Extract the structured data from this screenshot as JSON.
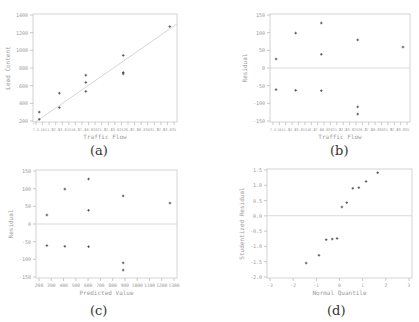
{
  "chart_data": [
    {
      "id": "a",
      "type": "scatter",
      "caption": "(a)",
      "title": "",
      "xlabel": "Traffic Flow",
      "ylabel": "Lead Content",
      "xlim": [
        7,
        37
      ],
      "ylim": [
        200,
        1400
      ],
      "yticks": [
        "1400",
        "1200",
        "1000",
        "800",
        "600",
        "400",
        "200"
      ],
      "xticks": [
        "7.5",
        "10",
        "11.3",
        "12.5",
        "13.8",
        "15",
        "16.3",
        "17.5",
        "18.8",
        "20",
        "21.3",
        "22.5",
        "23.8",
        "25",
        "26.3",
        "27.5",
        "28.8",
        "30",
        "31.3",
        "32.5",
        "33.8",
        "35"
      ],
      "grid": false,
      "has_fit_line": true,
      "fit_line": {
        "x": [
          7,
          37
        ],
        "y": [
          180,
          1290
        ]
      },
      "points": [
        {
          "x": 8.3,
          "y": 310
        },
        {
          "x": 8.3,
          "y": 230
        },
        {
          "x": 12.5,
          "y": 520
        },
        {
          "x": 12.5,
          "y": 360
        },
        {
          "x": 18.0,
          "y": 720
        },
        {
          "x": 18.0,
          "y": 640
        },
        {
          "x": 18.0,
          "y": 540
        },
        {
          "x": 25.8,
          "y": 940
        },
        {
          "x": 25.8,
          "y": 750
        },
        {
          "x": 25.8,
          "y": 735
        },
        {
          "x": 35.5,
          "y": 1260
        }
      ]
    },
    {
      "id": "b",
      "type": "scatter",
      "caption": "(b)",
      "xlabel": "Traffic Flow",
      "ylabel": "Residual",
      "xlim": [
        7,
        37
      ],
      "ylim": [
        -150,
        150
      ],
      "yticks": [
        "150",
        "100",
        "50",
        "0",
        "-50",
        "-100",
        "-150"
      ],
      "xticks": [
        "7.5",
        "10",
        "11.3",
        "12.5",
        "13.8",
        "15",
        "16.3",
        "17.5",
        "18.8",
        "20",
        "21.3",
        "22.5",
        "23.8",
        "25",
        "26.3",
        "27.5",
        "28.8",
        "30",
        "31.3",
        "32.5",
        "33.8",
        "35"
      ],
      "zero_line": true,
      "points": [
        {
          "x": 8.3,
          "y": 25
        },
        {
          "x": 8.3,
          "y": -60
        },
        {
          "x": 12.5,
          "y": 97
        },
        {
          "x": 12.5,
          "y": -62
        },
        {
          "x": 18.0,
          "y": 125
        },
        {
          "x": 18.0,
          "y": 38
        },
        {
          "x": 18.0,
          "y": -63
        },
        {
          "x": 25.8,
          "y": 78
        },
        {
          "x": 25.8,
          "y": -108
        },
        {
          "x": 25.8,
          "y": -128
        },
        {
          "x": 35.5,
          "y": 58
        }
      ]
    },
    {
      "id": "c",
      "type": "scatter",
      "caption": "(c)",
      "xlabel": "Predicted Value",
      "ylabel": "Residual",
      "xlim": [
        200,
        1300
      ],
      "ylim": [
        -150,
        150
      ],
      "yticks": [
        "150",
        "100",
        "50",
        "0",
        "-50",
        "-100",
        "-150"
      ],
      "xticks": [
        "200",
        "300",
        "400",
        "500",
        "600",
        "700",
        "800",
        "900",
        "1000",
        "1100",
        "1200",
        "1300"
      ],
      "zero_line": true,
      "points": [
        {
          "x": 285,
          "y": 25
        },
        {
          "x": 285,
          "y": -60
        },
        {
          "x": 425,
          "y": 97
        },
        {
          "x": 425,
          "y": -62
        },
        {
          "x": 610,
          "y": 125
        },
        {
          "x": 610,
          "y": 38
        },
        {
          "x": 610,
          "y": -63
        },
        {
          "x": 880,
          "y": 78
        },
        {
          "x": 880,
          "y": -108
        },
        {
          "x": 880,
          "y": -128
        },
        {
          "x": 1245,
          "y": 58
        }
      ]
    },
    {
      "id": "d",
      "type": "scatter",
      "caption": "(d)",
      "xlabel": "Normal Quantile",
      "ylabel": "Studentized Residual",
      "xlim": [
        -3,
        3
      ],
      "ylim": [
        -2.0,
        1.5
      ],
      "yticks": [
        "1.5",
        "1.0",
        "0.5",
        "0.0",
        "-0.5",
        "-1.0",
        "-1.5",
        "-2.0"
      ],
      "xticks": [
        "-3",
        "-2",
        "-1",
        "0",
        "1",
        "2",
        "3"
      ],
      "zero_line": true,
      "points": [
        {
          "x": -1.38,
          "y": -1.52
        },
        {
          "x": -0.85,
          "y": -1.27
        },
        {
          "x": -0.55,
          "y": -0.77
        },
        {
          "x": -0.3,
          "y": -0.75
        },
        {
          "x": -0.1,
          "y": -0.73
        },
        {
          "x": 0.1,
          "y": 0.28
        },
        {
          "x": 0.3,
          "y": 0.42
        },
        {
          "x": 0.55,
          "y": 0.88
        },
        {
          "x": 0.8,
          "y": 0.9
        },
        {
          "x": 1.1,
          "y": 1.1
        },
        {
          "x": 1.58,
          "y": 1.38
        }
      ]
    }
  ]
}
